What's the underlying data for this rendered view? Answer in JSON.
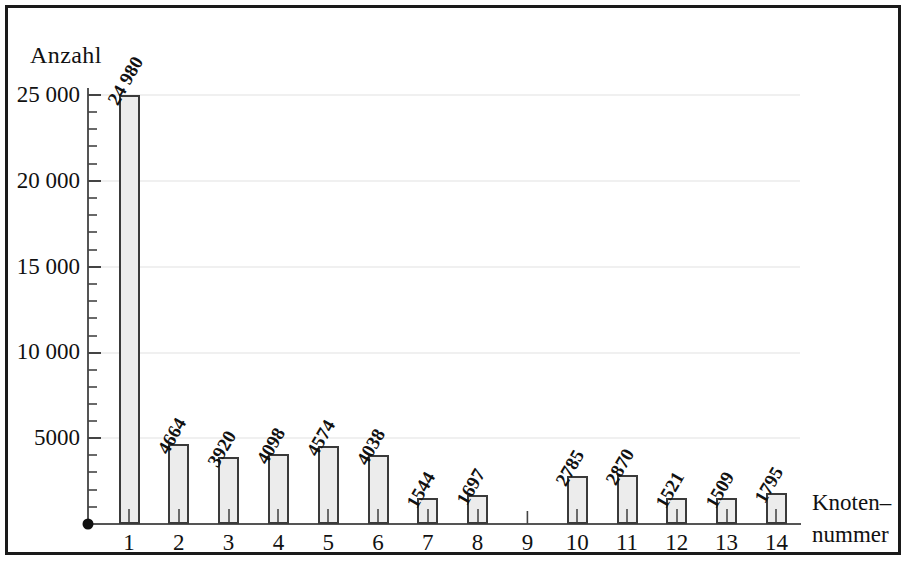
{
  "figure": {
    "y_axis_title": "Anzahl",
    "x_axis_title_line1": "Knoten–",
    "x_axis_title_line2": "nummer"
  },
  "chart_data": {
    "type": "bar",
    "title": "",
    "subtitle": "",
    "xlabel": "Knoten–nummer",
    "ylabel": "Anzahl",
    "ylim": [
      0,
      26000
    ],
    "ytick_values": [
      5000,
      10000,
      15000,
      20000,
      25000
    ],
    "ytick_labels": [
      "5000",
      "10 000",
      "15 000",
      "20 000",
      "25 000"
    ],
    "minor_tick_interval": 1000,
    "grid": true,
    "grid_axis": "y",
    "legend": "none",
    "categories": [
      "1",
      "2",
      "3",
      "4",
      "5",
      "6",
      "7",
      "8",
      "9",
      "10",
      "11",
      "12",
      "13",
      "14"
    ],
    "values": [
      24980,
      4664,
      3920,
      4098,
      4574,
      4038,
      1544,
      1697,
      0,
      2785,
      2870,
      1521,
      1509,
      1795
    ],
    "data_labels": [
      "24 980",
      "4664",
      "3920",
      "4098",
      "4574",
      "4038",
      "1544",
      "1697",
      "",
      "2785",
      "2870",
      "1521",
      "1509",
      "1795"
    ],
    "data_label_rotation_deg": -60,
    "bar_fill_color": "#ececec",
    "bar_edge_color": "#3a3a3a",
    "grid_color": "#e2e2e2",
    "axis_color": "#555555",
    "frame_color": "#1a1a1a"
  }
}
